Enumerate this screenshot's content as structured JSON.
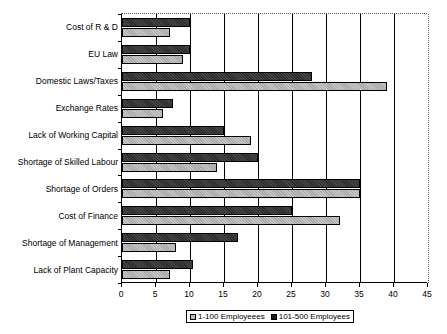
{
  "chart_data": {
    "type": "bar",
    "orientation": "horizontal",
    "title": "",
    "subtitle": "",
    "xlabel": "",
    "ylabel": "",
    "xlim": [
      0,
      45
    ],
    "xticks": [
      0,
      5,
      10,
      15,
      20,
      25,
      30,
      35,
      40,
      45
    ],
    "grid": true,
    "grid_axis": "x",
    "legend_position": "bottom",
    "categories": [
      "Cost of R & D",
      "EU Law",
      "Domestic Laws/Taxes",
      "Exchange Rates",
      "Lack of Working Capital",
      "Shortage of Skilled Labour",
      "Shortage of Orders",
      "Cost of Finance",
      "Shortage of Management",
      "Lack of Plant Capacity"
    ],
    "series": [
      {
        "name": "1-100 Employeees",
        "color": "#a8a8a8",
        "values": [
          7,
          9,
          39,
          6,
          19,
          14,
          35,
          32,
          8,
          7
        ]
      },
      {
        "name": "101-500 Employees",
        "color": "#1e1e1e",
        "values": [
          10,
          10,
          28,
          7.5,
          15,
          20,
          35,
          25,
          17,
          10.5
        ]
      }
    ]
  },
  "legend": {
    "entries": [
      {
        "label": "1-100 Employeees",
        "swatch": "light-hatched-square"
      },
      {
        "label": "101-500 Employees",
        "swatch": "dark-filled-square"
      }
    ]
  },
  "axis": {
    "x_tick_labels": [
      "0",
      "5",
      "10",
      "15",
      "20",
      "25",
      "30",
      "35",
      "40",
      "45"
    ],
    "y_tick_labels": [
      "Cost of R & D",
      "EU Law",
      "Domestic Laws/Taxes",
      "Exchange Rates",
      "Lack of Working Capital",
      "Shortage of Skilled Labour",
      "Shortage of Orders",
      "Cost of Finance",
      "Shortage of Management",
      "Lack of Plant Capacity"
    ]
  }
}
